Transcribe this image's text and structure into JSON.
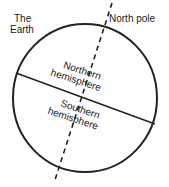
{
  "diagram": {
    "labels": {
      "earth_line1": "The",
      "earth_line2": "Earth",
      "north_pole": "North pole",
      "northern_line1": "Northern",
      "northern_line2": "hemisphere",
      "southern_line1": "Southern",
      "southern_line2": "hemisphere"
    },
    "colors": {
      "stroke": "#222222",
      "text": "#1a1a1a",
      "background": "#ffffff"
    }
  }
}
